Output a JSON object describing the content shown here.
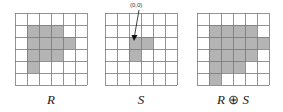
{
  "colors": {
    "fill": "#b4b4b4",
    "grid": "#777777",
    "arrow": "#111111"
  },
  "grid_size": 6,
  "cell_px": 12,
  "panels": [
    {
      "id": "R",
      "caption": "R",
      "left": 15,
      "filled": [
        [
          1,
          1
        ],
        [
          1,
          2
        ],
        [
          1,
          3
        ],
        [
          2,
          1
        ],
        [
          2,
          2
        ],
        [
          2,
          3
        ],
        [
          2,
          4
        ],
        [
          3,
          1
        ],
        [
          3,
          2
        ],
        [
          3,
          3
        ],
        [
          4,
          1
        ]
      ]
    },
    {
      "id": "S",
      "caption": "S",
      "left": 105,
      "filled": [
        [
          2,
          2
        ],
        [
          2,
          3
        ],
        [
          3,
          2
        ]
      ],
      "origin": {
        "label": "(0,0)",
        "row": 2,
        "col": 2
      }
    },
    {
      "id": "RS",
      "caption_left": "R",
      "caption_op": " ⊕ ",
      "caption_right": "S",
      "left": 197,
      "filled": [
        [
          1,
          1
        ],
        [
          1,
          2
        ],
        [
          1,
          3
        ],
        [
          1,
          4
        ],
        [
          2,
          1
        ],
        [
          2,
          2
        ],
        [
          2,
          3
        ],
        [
          2,
          4
        ],
        [
          2,
          5
        ],
        [
          3,
          1
        ],
        [
          3,
          2
        ],
        [
          3,
          3
        ],
        [
          3,
          4
        ],
        [
          4,
          1
        ],
        [
          4,
          2
        ],
        [
          4,
          3
        ],
        [
          5,
          1
        ]
      ]
    }
  ]
}
